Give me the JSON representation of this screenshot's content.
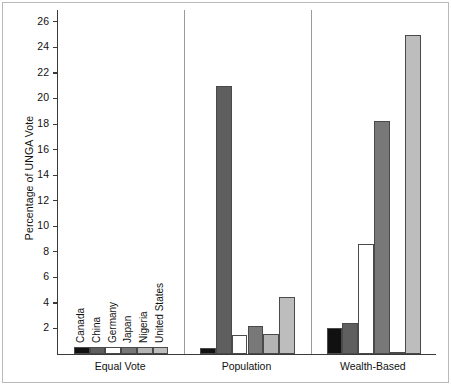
{
  "chart_data": {
    "type": "bar",
    "title": "",
    "subtitle": "",
    "xlabel": "",
    "ylabel": "Percentage of UNGA Vote",
    "ylim": [
      0,
      27
    ],
    "yticks": [
      2,
      4,
      6,
      8,
      10,
      12,
      14,
      16,
      18,
      20,
      22,
      24,
      26
    ],
    "grid": false,
    "legend_position": "none",
    "panels": [
      "Equal Vote",
      "Population",
      "Wealth-Based"
    ],
    "categories": [
      "Canada",
      "China",
      "Germany",
      "Japan",
      "Nigeria",
      "United States"
    ],
    "series": [
      {
        "name": "Equal Vote",
        "values": [
          0.52,
          0.52,
          0.52,
          0.52,
          0.52,
          0.52
        ]
      },
      {
        "name": "Population",
        "values": [
          0.5,
          21.0,
          1.5,
          2.2,
          1.6,
          4.5
        ]
      },
      {
        "name": "Wealth-Based",
        "values": [
          2.0,
          2.4,
          8.6,
          18.2,
          0.15,
          25.0
        ]
      }
    ],
    "colors": {
      "Canada": "#111111",
      "China": "#5f5f5f",
      "Germany": "#ffffff",
      "Japan": "#787878",
      "Nigeria": "#b4b4b4",
      "United States": "#bdbdbd"
    },
    "bar_edge_color": "#4a4a4a",
    "axis_color": "#3a3a3a",
    "panel_divider_color": "#9a9a9a",
    "background_color": "#ffffff"
  },
  "axis": {
    "y_title": "Percentage of UNGA Vote"
  }
}
